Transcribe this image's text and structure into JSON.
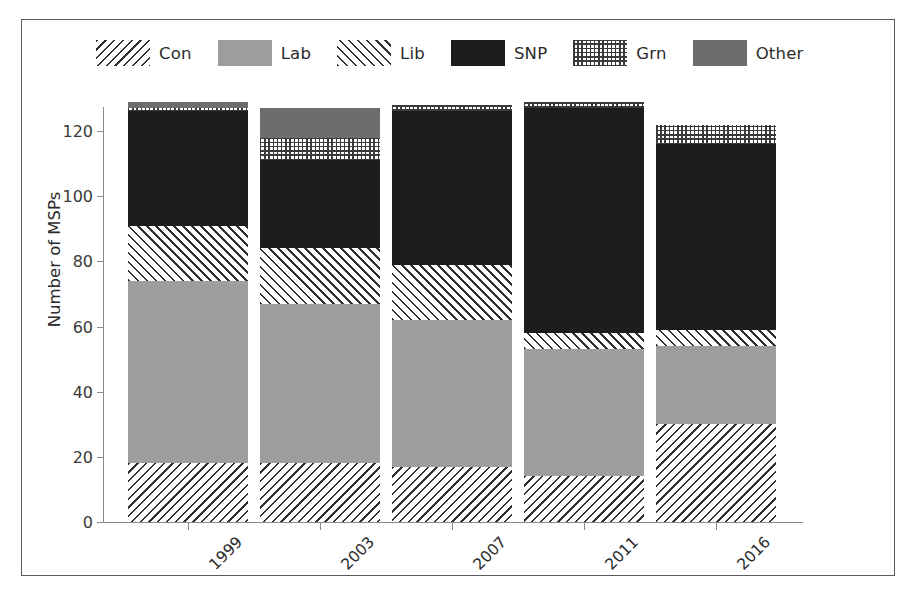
{
  "chart_data": {
    "type": "bar",
    "subtype": "stacked-vertical",
    "title": "",
    "xlabel": "",
    "ylabel": "Number of MSPs",
    "categories": [
      "1999",
      "2003",
      "2007",
      "2011",
      "2016"
    ],
    "series": [
      {
        "name": "Con",
        "values": [
          18,
          18,
          17,
          14,
          30
        ],
        "pattern": "diagonal-backslash-hatch",
        "color": "#2f2f2f"
      },
      {
        "name": "Lab",
        "values": [
          56,
          49,
          45,
          39,
          24
        ],
        "pattern": "solid-light-grey",
        "color": "#9d9d9d"
      },
      {
        "name": "Lib",
        "values": [
          17,
          17,
          17,
          5,
          5
        ],
        "pattern": "diagonal-forwardslash-hatch",
        "color": "#2f2f2f"
      },
      {
        "name": "SNP",
        "values": [
          35,
          27,
          47,
          69,
          57
        ],
        "pattern": "solid-black",
        "color": "#1d1d1d"
      },
      {
        "name": "Grn",
        "values": [
          1,
          7,
          2,
          2,
          6
        ],
        "pattern": "fine-dot-grid",
        "color": "#3a3a3a"
      },
      {
        "name": "Other",
        "values": [
          2,
          9,
          0,
          0,
          0
        ],
        "pattern": "solid-dark-grey",
        "color": "#6d6d6d"
      }
    ],
    "totals": [
      129,
      127,
      128,
      129,
      122
    ],
    "ylim": [
      0,
      130
    ],
    "yticks": [
      0,
      20,
      40,
      60,
      80,
      100,
      120
    ],
    "ytick_labels": [
      "0",
      "20",
      "40",
      "60",
      "80",
      "100",
      "120"
    ],
    "grid": false,
    "legend_position": "top",
    "xtick_label_rotation": -45
  },
  "yaxis": {
    "label": "Number of MSPs",
    "ticks": [
      {
        "value": 120,
        "label": "120"
      },
      {
        "value": 100,
        "label": "100"
      },
      {
        "value": 80,
        "label": "80"
      },
      {
        "value": 60,
        "label": "60"
      },
      {
        "value": 40,
        "label": "40"
      },
      {
        "value": 20,
        "label": "20"
      },
      {
        "value": 0,
        "label": "0"
      }
    ]
  },
  "xaxis": {
    "label": "",
    "ticks": [
      {
        "label": "1999"
      },
      {
        "label": "2003"
      },
      {
        "label": "2007"
      },
      {
        "label": "2011"
      },
      {
        "label": "2016"
      }
    ]
  },
  "legend": {
    "entries": [
      {
        "label": "Con",
        "swatch": "fill-con"
      },
      {
        "label": "Lab",
        "swatch": "fill-lab"
      },
      {
        "label": "Lib",
        "swatch": "fill-lib"
      },
      {
        "label": "SNP",
        "swatch": "fill-snp"
      },
      {
        "label": "Grn",
        "swatch": "fill-grn"
      },
      {
        "label": "Other",
        "swatch": "fill-other"
      }
    ]
  },
  "colors": {
    "con": "#2f2f2f",
    "lab": "#9d9d9d",
    "lib": "#2f2f2f",
    "snp": "#1d1d1d",
    "grn": "#3a3a3a",
    "other": "#6d6d6d",
    "axis": "#8a8a8a",
    "frame": "#5a5a5a",
    "text": "#2b2b2b",
    "background": "#ffffff"
  }
}
